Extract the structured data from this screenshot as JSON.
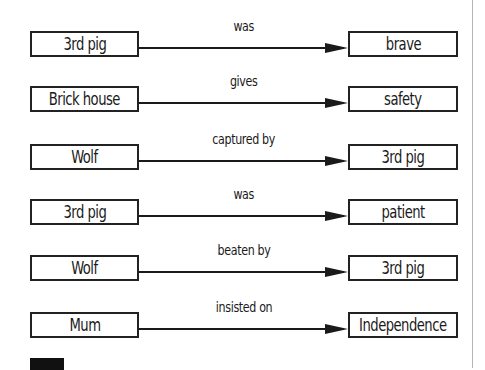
{
  "diagram": {
    "relations": [
      {
        "source": "3rd pig",
        "label": "was",
        "target": "brave"
      },
      {
        "source": "Brick house",
        "label": "gives",
        "target": "safety"
      },
      {
        "source": "Wolf",
        "label": "captured by",
        "target": "3rd pig"
      },
      {
        "source": "3rd pig",
        "label": "was",
        "target": "patient"
      },
      {
        "source": "Wolf",
        "label": "beaten by",
        "target": "3rd pig"
      },
      {
        "source": "Mum",
        "label": "insisted on",
        "target": "Independence"
      }
    ],
    "colors": {
      "box_border": "#222222",
      "arrow": "#1a1a1a",
      "divider": "#b5b5b5"
    }
  }
}
